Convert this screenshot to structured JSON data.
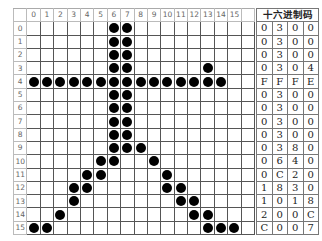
{
  "grid": {
    "column_headers": [
      "0",
      "1",
      "2",
      "3",
      "4",
      "5",
      "6",
      "7",
      "8",
      "9",
      "10",
      "11",
      "12",
      "13",
      "14",
      "15",
      ""
    ],
    "row_headers": [
      "0",
      "1",
      "2",
      "3",
      "4",
      "5",
      "6",
      "7",
      "8",
      "9",
      "10",
      "11",
      "12",
      "13",
      "14",
      "15"
    ],
    "rows": [
      "0000001100000000",
      "0000001100000000",
      "0000001100000000",
      "0000001100000100",
      "1111111111111110",
      "0000001100000000",
      "0000001100000000",
      "0000001100000000",
      "0000001100000000",
      "0000001110000000",
      "0000011001000000",
      "0000110000100000",
      "0001100000110000",
      "0001000000011000",
      "0010000000001100",
      "1100000000000111"
    ]
  },
  "hex_table": {
    "title": "十六进制码",
    "rows": [
      [
        "0",
        "3",
        "0",
        "0"
      ],
      [
        "0",
        "3",
        "0",
        "0"
      ],
      [
        "0",
        "3",
        "0",
        "0"
      ],
      [
        "0",
        "3",
        "0",
        "4"
      ],
      [
        "F",
        "F",
        "F",
        "E"
      ],
      [
        "0",
        "3",
        "0",
        "0"
      ],
      [
        "0",
        "3",
        "0",
        "0"
      ],
      [
        "0",
        "3",
        "0",
        "0"
      ],
      [
        "0",
        "3",
        "0",
        "0"
      ],
      [
        "0",
        "3",
        "8",
        "0"
      ],
      [
        "0",
        "6",
        "4",
        "0"
      ],
      [
        "0",
        "C",
        "2",
        "0"
      ],
      [
        "1",
        "8",
        "3",
        "0"
      ],
      [
        "1",
        "0",
        "1",
        "8"
      ],
      [
        "2",
        "0",
        "0",
        "C"
      ],
      [
        "C",
        "0",
        "0",
        "7"
      ]
    ]
  }
}
